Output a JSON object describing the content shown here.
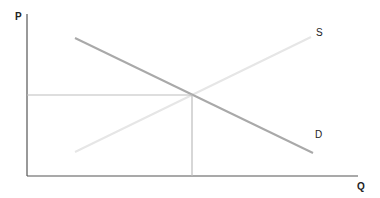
{
  "diagram": {
    "type": "supply-demand",
    "axes": {
      "y_label": "P",
      "x_label": "Q"
    },
    "curves": [
      {
        "name": "supply",
        "label": "S",
        "color": "#e6e6e6"
      },
      {
        "name": "demand",
        "label": "D",
        "color": "#a9a9a9"
      }
    ],
    "equilibrium_guides": {
      "color": "#bdbdbd"
    },
    "axis_color": "#555555"
  }
}
